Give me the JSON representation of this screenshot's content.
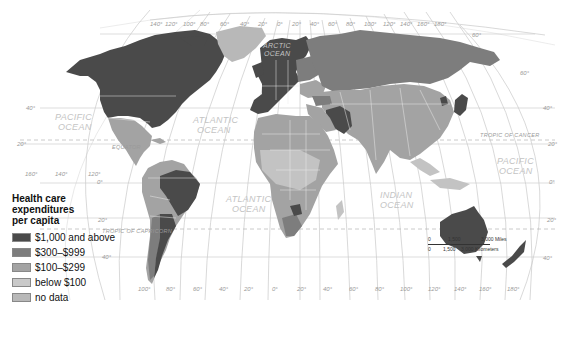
{
  "legend": {
    "title_lines": [
      "Health care",
      "expenditures",
      "per capita"
    ],
    "items": [
      {
        "label": "$1,000 and above",
        "color": "#4a4a4a"
      },
      {
        "label": "$300–$999",
        "color": "#7d7d7d"
      },
      {
        "label": "$100–$299",
        "color": "#a3a3a3"
      },
      {
        "label": "below $100",
        "color": "#c9c9c9"
      },
      {
        "label": "no data",
        "color": "#b8b8b8"
      }
    ]
  },
  "oceans": [
    {
      "name": "pacific_ne",
      "lines": [
        "PACIFIC",
        "OCEAN"
      ]
    },
    {
      "name": "atlantic_n",
      "lines": [
        "ATLANTIC",
        "OCEAN"
      ]
    },
    {
      "name": "arctic",
      "lines": [
        "ARCTIC",
        "OCEAN"
      ]
    },
    {
      "name": "atlantic_s",
      "lines": [
        "ATLANTIC",
        "OCEAN"
      ]
    },
    {
      "name": "indian",
      "lines": [
        "INDIAN",
        "OCEAN"
      ]
    },
    {
      "name": "pacific_e",
      "lines": [
        "PACIFIC",
        "OCEAN"
      ]
    }
  ],
  "reference_lines": {
    "equator": "EQUATOR",
    "tropic_cancer": "TROPIC OF CANCER",
    "tropic_capricorn": "TROPIC OF CAPRICORN"
  },
  "longitude_top": [
    "140°",
    "120°",
    "100°",
    "80°",
    "60°",
    "40°",
    "20°",
    "0°",
    "20°",
    "40°",
    "60°",
    "80°",
    "100°",
    "120°",
    "140°",
    "160°",
    "180°"
  ],
  "longitude_bottom": [
    "100°",
    "80°",
    "60°",
    "40°",
    "20°",
    "0°",
    "20°",
    "40°",
    "60°",
    "80°",
    "100°",
    "120°",
    "140°",
    "160°",
    "180°"
  ],
  "longitude_left": [
    "160°",
    "140°",
    "120°"
  ],
  "latitude_left": [
    "40°",
    "20°",
    "0°",
    "20°",
    "40°"
  ],
  "latitude_right": [
    "60°",
    "60°",
    "40°",
    "20°",
    "0°",
    "20°",
    "40°"
  ],
  "scale_bar": {
    "miles": [
      "0",
      "1,500",
      "3,000 Miles"
    ],
    "kilometers": [
      "0",
      "1,500",
      "3,000 Kilometers"
    ]
  }
}
